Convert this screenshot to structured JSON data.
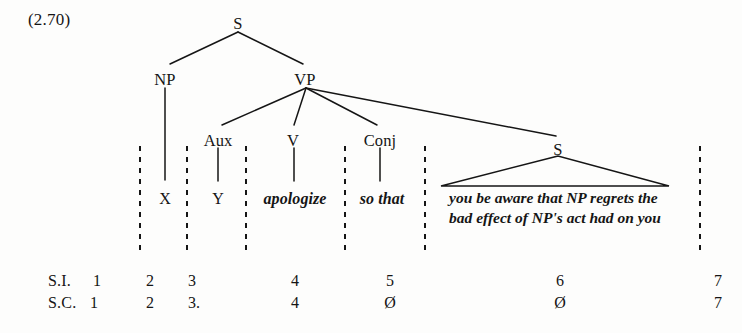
{
  "figure": {
    "example_number": "(2.70)",
    "type": "syntax-tree"
  },
  "tree": {
    "nodes": [
      {
        "id": "s-root",
        "label": "S",
        "x": 238,
        "y": 14
      },
      {
        "id": "np",
        "label": "NP",
        "x": 165,
        "y": 70
      },
      {
        "id": "vp",
        "label": "VP",
        "x": 305,
        "y": 70
      },
      {
        "id": "aux",
        "label": "Aux",
        "x": 218,
        "y": 131
      },
      {
        "id": "v",
        "label": "V",
        "x": 293,
        "y": 131
      },
      {
        "id": "conj",
        "label": "Conj",
        "x": 380,
        "y": 131
      },
      {
        "id": "s-embed",
        "label": "S",
        "x": 558,
        "y": 140
      }
    ],
    "terminals": [
      {
        "id": "term-x",
        "label": "X",
        "x": 165,
        "y": 190,
        "italic": false
      },
      {
        "id": "term-y",
        "label": "Y",
        "x": 218,
        "y": 190,
        "italic": false
      },
      {
        "id": "term-apologize",
        "label": "apologize",
        "x": 295,
        "y": 190,
        "italic": true
      },
      {
        "id": "term-so-that",
        "label": "so that",
        "x": 382,
        "y": 190,
        "italic": true
      }
    ],
    "embedded_phrase": {
      "id": "term-embedded-clause",
      "x": 555,
      "y": 188,
      "lines": [
        "you be aware that NP regrets the",
        "bad effect of NP's act had on you"
      ]
    }
  },
  "legend": {
    "rows": [
      {
        "id": "structural-index",
        "tag": "S.I.",
        "tag_x": 48,
        "y": 272,
        "cells": [
          {
            "value": "1",
            "x": 97
          },
          {
            "value": "2",
            "x": 150
          },
          {
            "value": "3",
            "x": 192
          },
          {
            "value": "4",
            "x": 295
          },
          {
            "value": "5",
            "x": 390
          },
          {
            "value": "6",
            "x": 560
          },
          {
            "value": "7",
            "x": 718
          }
        ]
      },
      {
        "id": "structural-change",
        "tag": "S.C.",
        "tag_x": 48,
        "y": 294,
        "cells": [
          {
            "value": "1",
            "x": 94
          },
          {
            "value": "2",
            "x": 150
          },
          {
            "value": "3.",
            "x": 194
          },
          {
            "value": "4",
            "x": 295
          },
          {
            "value": "Ø",
            "x": 390
          },
          {
            "value": "Ø",
            "x": 560
          },
          {
            "value": "7",
            "x": 718
          }
        ]
      }
    ]
  },
  "style": {
    "ink": "#151515",
    "background": "#fdfdfc"
  }
}
